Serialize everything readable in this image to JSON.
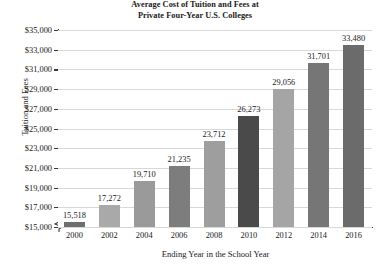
{
  "chart_data": {
    "type": "bar",
    "title": "Average Cost of Tuition and Fees at Private Four-Year U.S. Colleges",
    "title_line1": "Average Cost of Tuition and Fees at",
    "title_line2": "Private Four-Year U.S. Colleges",
    "xlabel": "Ending Year in the School Year",
    "ylabel": "Tuition and Fees",
    "categories": [
      "2000",
      "2002",
      "2004",
      "2006",
      "2008",
      "2010",
      "2012",
      "2014",
      "2016"
    ],
    "values": [
      15518,
      17272,
      19710,
      21235,
      23712,
      26273,
      29056,
      31701,
      33480
    ],
    "value_labels": [
      "15,518",
      "17,272",
      "19,710",
      "21,235",
      "23,712",
      "26,273",
      "29,056",
      "31,701",
      "33,480"
    ],
    "bar_colors": [
      "#6e6e6e",
      "#a9a9a9",
      "#9a9a9a",
      "#7d7d7d",
      "#9e9e9e",
      "#4a4a4a",
      "#a5a5a5",
      "#767676",
      "#6b6b6b"
    ],
    "ylim": [
      15000,
      35000
    ],
    "ytick_values": [
      35000,
      33000,
      31000,
      29000,
      27000,
      25000,
      23000,
      21000,
      19000,
      17000,
      15000
    ],
    "ytick_labels": [
      "$35,000",
      "$33,000",
      "$31,000",
      "$29,000",
      "$27,000",
      "$25,000",
      "$23,000",
      "$21,000",
      "$19,000",
      "$17,000",
      "$15,000"
    ],
    "grid": true,
    "grid_color": "#d8d8d8",
    "axis_color": "#3a3a3a",
    "legend": null,
    "axis_break": true
  }
}
